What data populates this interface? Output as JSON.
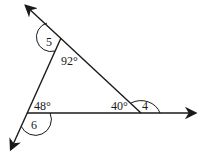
{
  "diagram": {
    "type": "triangle-exterior-angles",
    "stroke_color": "#1a1a1a",
    "background": "#ffffff",
    "vertices": {
      "top": {
        "x": 61,
        "y": 38
      },
      "bottom_left": {
        "x": 27,
        "y": 113
      },
      "bottom_right": {
        "x": 141,
        "y": 113
      }
    },
    "angles": {
      "interior_top": "92°",
      "interior_bottom_left": "48°",
      "interior_bottom_right": "40°",
      "exterior_top": "5",
      "exterior_bottom_left": "6",
      "exterior_bottom_right": "4"
    }
  }
}
